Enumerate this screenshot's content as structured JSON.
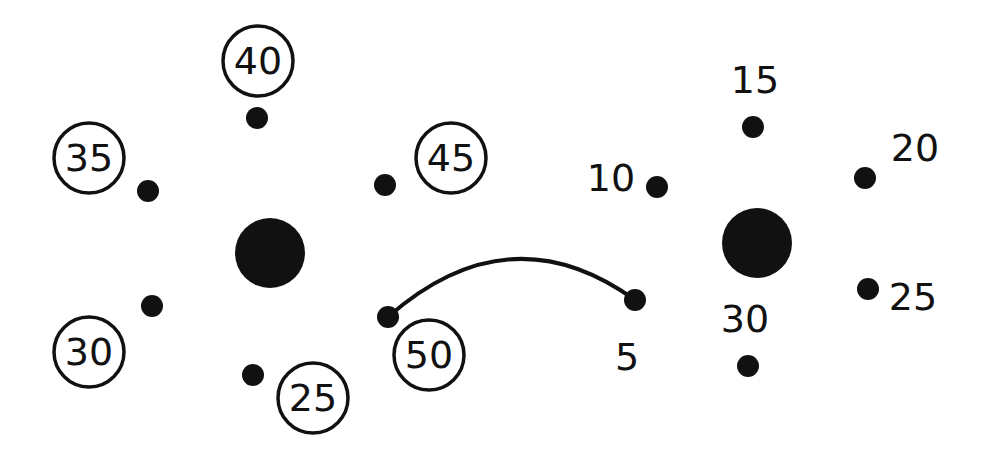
{
  "diagram": {
    "title": "",
    "type": "clock-face dot diagram",
    "colors": {
      "ink": "#111111",
      "background": "#ffffff"
    },
    "clocks": [
      {
        "name": "left-clock",
        "center": {
          "x": 270,
          "y": 253,
          "r": 35
        },
        "label_style": "circled",
        "marks": [
          {
            "label": "40",
            "dot": {
              "x": 257,
              "y": 118
            },
            "text": {
              "x": 258,
              "y": 61
            }
          },
          {
            "label": "45",
            "dot": {
              "x": 385,
              "y": 185
            },
            "text": {
              "x": 451,
              "y": 158
            }
          },
          {
            "label": "50",
            "dot": {
              "x": 388,
              "y": 317
            },
            "text": {
              "x": 429,
              "y": 355
            }
          },
          {
            "label": "25",
            "dot": {
              "x": 253,
              "y": 375
            },
            "text": {
              "x": 313,
              "y": 398
            }
          },
          {
            "label": "30",
            "dot": {
              "x": 152,
              "y": 306
            },
            "text": {
              "x": 89,
              "y": 352
            }
          },
          {
            "label": "35",
            "dot": {
              "x": 148,
              "y": 191
            },
            "text": {
              "x": 89,
              "y": 158
            }
          }
        ]
      },
      {
        "name": "right-clock",
        "center": {
          "x": 757,
          "y": 243,
          "r": 35
        },
        "label_style": "plain",
        "marks": [
          {
            "label": "15",
            "dot": {
              "x": 753,
              "y": 127
            },
            "text": {
              "x": 755,
              "y": 80
            }
          },
          {
            "label": "20",
            "dot": {
              "x": 865,
              "y": 178
            },
            "text": {
              "x": 915,
              "y": 148
            }
          },
          {
            "label": "25",
            "dot": {
              "x": 868,
              "y": 289
            },
            "text": {
              "x": 913,
              "y": 297
            }
          },
          {
            "label": "30",
            "dot": {
              "x": 748,
              "y": 366
            },
            "text": {
              "x": 745,
              "y": 319
            }
          },
          {
            "label": "5",
            "dot": {
              "x": 635,
              "y": 300
            },
            "text": {
              "x": 627,
              "y": 357
            }
          },
          {
            "label": "10",
            "dot": {
              "x": 657,
              "y": 187
            },
            "text": {
              "x": 611,
              "y": 178
            }
          }
        ]
      }
    ],
    "connector": {
      "name": "arc-50-to-5",
      "from_label": "50",
      "to_label": "5",
      "path": "M 388 317 Q 510 210 635 300"
    }
  }
}
